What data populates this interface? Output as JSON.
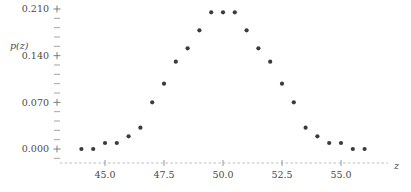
{
  "chart_data": {
    "type": "scatter",
    "title": "",
    "subtitle": "",
    "xlabel": "z",
    "ylabel": "p(z)",
    "xlim": [
      43.3,
      56.8
    ],
    "ylim": [
      -0.012,
      0.222
    ],
    "grid": false,
    "legend": null,
    "x_ticks": [
      "45.0",
      "47.5",
      "50.0",
      "52.5",
      "55.0"
    ],
    "x_tick_values": [
      45.0,
      47.5,
      50.0,
      52.5,
      55.0
    ],
    "x_minor_tick_values": [
      43.5,
      44.0,
      44.5,
      45.5,
      46.0,
      46.5,
      47.0,
      48.0,
      48.5,
      49.0,
      49.5,
      50.5,
      51.0,
      51.5,
      52.0,
      53.0,
      53.5,
      54.0,
      54.5,
      55.5,
      56.0,
      56.5
    ],
    "y_ticks": [
      "0.000",
      "0.070",
      "0.140",
      "0.210"
    ],
    "y_tick_values": [
      0.0,
      0.07,
      0.14,
      0.21
    ],
    "y_minor_tick_values": [
      0.014,
      0.028,
      0.042,
      0.056,
      0.084,
      0.098,
      0.112,
      0.126,
      0.154,
      0.168,
      0.182,
      0.196,
      -0.014
    ],
    "point_color": "#3b3b3b",
    "point_radius": 2.1,
    "x": [
      44.0,
      44.5,
      45.0,
      45.5,
      46.0,
      46.5,
      47.0,
      47.5,
      48.0,
      48.5,
      49.0,
      49.5,
      50.0,
      50.5,
      51.0,
      51.5,
      52.0,
      52.5,
      53.0,
      53.5,
      54.0,
      54.5,
      55.0,
      55.5,
      56.0
    ],
    "y": [
      0.0,
      0.0,
      0.009,
      0.009,
      0.019,
      0.032,
      0.07,
      0.098,
      0.131,
      0.151,
      0.178,
      0.205,
      0.205,
      0.205,
      0.178,
      0.151,
      0.131,
      0.098,
      0.07,
      0.032,
      0.019,
      0.009,
      0.009,
      0.0,
      0.0
    ],
    "points": [
      {
        "x": 44.0,
        "y": 0.0
      },
      {
        "x": 44.5,
        "y": 0.0
      },
      {
        "x": 45.0,
        "y": 0.009
      },
      {
        "x": 45.5,
        "y": 0.009
      },
      {
        "x": 46.0,
        "y": 0.019
      },
      {
        "x": 46.5,
        "y": 0.032
      },
      {
        "x": 47.0,
        "y": 0.07
      },
      {
        "x": 47.5,
        "y": 0.098
      },
      {
        "x": 48.0,
        "y": 0.131
      },
      {
        "x": 48.5,
        "y": 0.151
      },
      {
        "x": 49.0,
        "y": 0.178
      },
      {
        "x": 49.5,
        "y": 0.205
      },
      {
        "x": 50.0,
        "y": 0.205
      },
      {
        "x": 50.5,
        "y": 0.205
      },
      {
        "x": 51.0,
        "y": 0.178
      },
      {
        "x": 51.5,
        "y": 0.151
      },
      {
        "x": 52.0,
        "y": 0.131
      },
      {
        "x": 52.5,
        "y": 0.098
      },
      {
        "x": 53.0,
        "y": 0.07
      },
      {
        "x": 53.5,
        "y": 0.032
      },
      {
        "x": 54.0,
        "y": 0.019
      },
      {
        "x": 54.5,
        "y": 0.009
      },
      {
        "x": 55.0,
        "y": 0.009
      },
      {
        "x": 55.5,
        "y": 0.0
      },
      {
        "x": 56.0,
        "y": 0.0
      }
    ]
  },
  "axes": {
    "y_label_text": "p(z)",
    "x_label_text": "z"
  }
}
